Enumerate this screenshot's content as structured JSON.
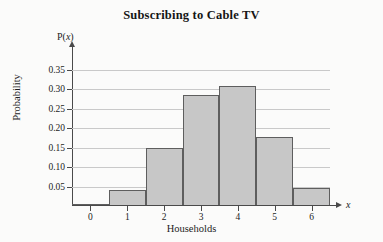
{
  "chart_data": {
    "type": "bar",
    "title": "Subscribing to Cable TV",
    "xlabel": "Households",
    "ylabel": "Probability",
    "x_axis_symbol": "x",
    "y_axis_symbol": "P(x)",
    "categories": [
      "0",
      "1",
      "2",
      "3",
      "4",
      "5",
      "6"
    ],
    "values": [
      0.003,
      0.042,
      0.15,
      0.285,
      0.308,
      0.178,
      0.045
    ],
    "xlim": [
      -0.5,
      6.5
    ],
    "ylim": [
      0,
      0.375
    ],
    "ytick_labels": [
      "0.05",
      "0.10",
      "0.15",
      "0.20",
      "0.25",
      "0.30",
      "0.35"
    ],
    "ytick_values": [
      0.05,
      0.1,
      0.15,
      0.2,
      0.25,
      0.3,
      0.35
    ],
    "grid": true,
    "legend": false,
    "bar_fill_color": "#c7c7c7",
    "bar_edge_color": "#5e5e5e",
    "gridline_color": "#c9c9c9",
    "axis_color": "#4a4a4a",
    "background_color": "#fbfbfa"
  }
}
